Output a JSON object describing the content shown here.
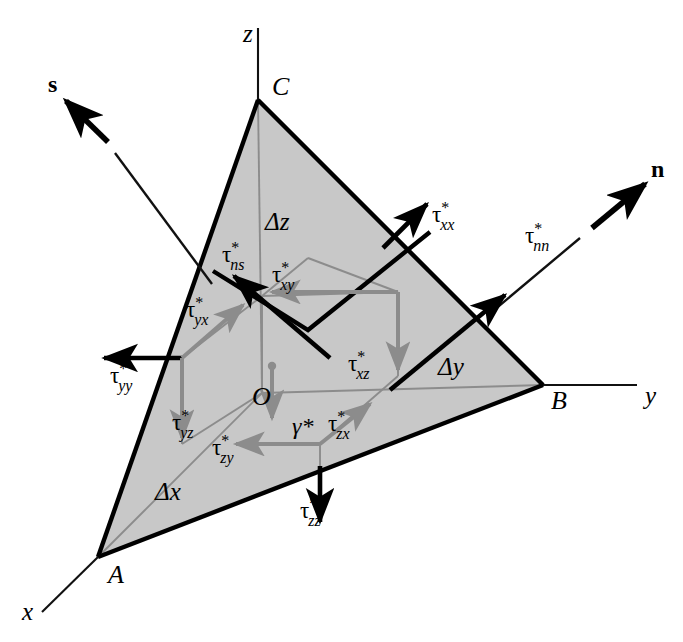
{
  "figure": {
    "type": "stress-tetrahedron-diagram",
    "background_color": "#ffffff",
    "face_fill_color": "#c8c8c8",
    "bold_stroke_color": "#000000",
    "gray_stroke_color": "#8c8c8c",
    "thin_stroke_color": "#1a1a1a"
  },
  "axes": [
    {
      "name": "x-axis",
      "label": "x",
      "label_x": 22,
      "label_y": 620
    },
    {
      "name": "y-axis",
      "label": "y",
      "label_x": 645,
      "label_y": 404
    },
    {
      "name": "z-axis",
      "label": "z",
      "label_x": 243,
      "label_y": 42
    }
  ],
  "vertices": [
    {
      "name": "vertex-a",
      "label": "A",
      "label_x": 108,
      "label_y": 583,
      "px": 98,
      "py": 557
    },
    {
      "name": "vertex-b",
      "label": "B",
      "label_x": 551,
      "label_y": 409,
      "px": 543,
      "py": 385
    },
    {
      "name": "vertex-c",
      "label": "C",
      "label_x": 272,
      "label_y": 95,
      "px": 258,
      "py": 100
    },
    {
      "name": "origin",
      "label": "O",
      "label_x": 252,
      "label_y": 405,
      "px": 262,
      "py": 393
    }
  ],
  "edge_lengths": [
    {
      "name": "delta-x",
      "label": "Δx",
      "label_x": 155,
      "label_y": 500
    },
    {
      "name": "delta-y",
      "label": "Δy",
      "label_x": 438,
      "label_y": 375
    },
    {
      "name": "delta-z",
      "label": "Δz",
      "label_x": 265,
      "label_y": 230
    }
  ],
  "unit_vectors": [
    {
      "name": "normal-vector-n",
      "label": "n",
      "label_x": 651,
      "label_y": 177,
      "bold": true
    },
    {
      "name": "shear-vector-s",
      "label": "s",
      "label_x": 48,
      "label_y": 92,
      "bold": true
    }
  ],
  "body_force": {
    "name": "gravity-term",
    "label": "γ*",
    "label_x": 292,
    "label_y": 434
  },
  "stress_components": [
    {
      "name": "tau-nn",
      "base": "τ",
      "sub": "nn",
      "sup": "*",
      "label_x": 525,
      "label_y": 243,
      "color": "black",
      "description": "normal stress on inclined plane"
    },
    {
      "name": "tau-ns",
      "base": "τ",
      "sub": "ns",
      "sup": "*",
      "label_x": 222,
      "label_y": 262,
      "color": "black",
      "description": "shear stress on inclined plane"
    },
    {
      "name": "tau-xx",
      "base": "τ",
      "sub": "xx",
      "sup": "*",
      "label_x": 432,
      "label_y": 222,
      "color": "black",
      "description": "normal stress x-face"
    },
    {
      "name": "tau-yy",
      "base": "τ",
      "sub": "yy",
      "sup": "*",
      "label_x": 110,
      "label_y": 383,
      "color": "black",
      "description": "normal stress y-face"
    },
    {
      "name": "tau-zz",
      "base": "τ",
      "sub": "zz",
      "sup": "*",
      "label_x": 300,
      "label_y": 518,
      "color": "black",
      "description": "normal stress z-face"
    },
    {
      "name": "tau-xy",
      "base": "τ",
      "sub": "xy",
      "sup": "*",
      "label_x": 272,
      "label_y": 282,
      "color": "gray",
      "description": "shear stress x-face y-direction"
    },
    {
      "name": "tau-xz",
      "base": "τ",
      "sub": "xz",
      "sup": "*",
      "label_x": 348,
      "label_y": 371,
      "color": "gray",
      "description": "shear stress x-face z-direction"
    },
    {
      "name": "tau-yx",
      "base": "τ",
      "sub": "yx",
      "sup": "*",
      "label_x": 186,
      "label_y": 317,
      "color": "gray",
      "description": "shear stress y-face x-direction"
    },
    {
      "name": "tau-yz",
      "base": "τ",
      "sub": "yz",
      "sup": "*",
      "label_x": 172,
      "label_y": 430,
      "color": "gray",
      "description": "shear stress y-face z-direction"
    },
    {
      "name": "tau-zx",
      "base": "τ",
      "sub": "zx",
      "sup": "*",
      "label_x": 328,
      "label_y": 431,
      "color": "gray",
      "description": "shear stress z-face x-direction"
    },
    {
      "name": "tau-zy",
      "base": "τ",
      "sub": "zy",
      "sup": "*",
      "label_x": 212,
      "label_y": 455,
      "color": "gray",
      "description": "shear stress z-face y-direction"
    }
  ]
}
